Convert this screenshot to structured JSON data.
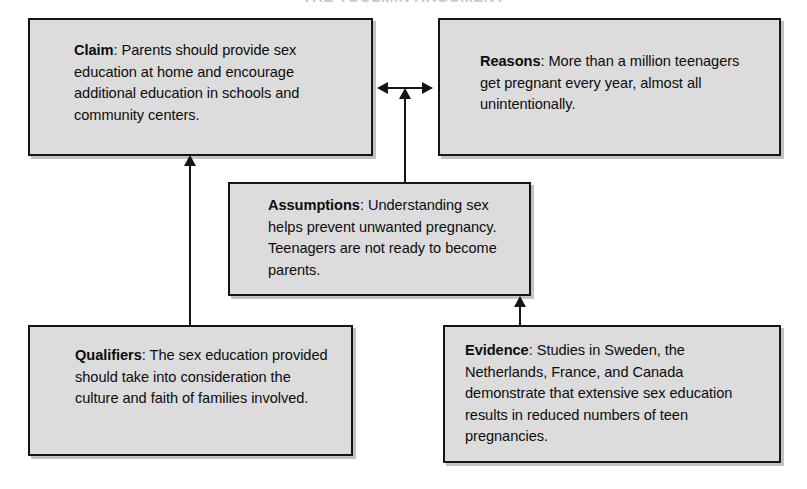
{
  "title": {
    "text": "THE TOULMIN ARGUMENT"
  },
  "diagram": {
    "nodes": {
      "claim": {
        "label": "Claim",
        "separator": ": ",
        "body": "Parents should provide sex education at home and encourage additional education in schools and community centers."
      },
      "reasons": {
        "label": "Reasons",
        "separator": ": ",
        "body": "More than a million teenagers get pregnant every year, almost all unintentionally."
      },
      "assumptions": {
        "label": "Assumptions",
        "separator": ": ",
        "body": "Understanding sex helps prevent unwanted pregnancy. Teenagers are not ready to become parents."
      },
      "qualifiers": {
        "label": "Qualifiers",
        "separator": ": ",
        "body": "The sex education provided should take into consideration the culture and faith of families involved."
      },
      "evidence": {
        "label": "Evidence",
        "separator": ": ",
        "body": "Studies in Sweden, the Netherlands, France, and Canada demonstrate that extensive sex education results in reduced numbers of teen pregnancies."
      }
    },
    "connectors": [
      {
        "name": "claim-reasons",
        "from": "claim",
        "to": "reasons",
        "style": "double-arrow-horizontal"
      },
      {
        "name": "assumptions-claim-reasons",
        "from": "assumptions",
        "to": "claim-reasons",
        "style": "arrow-up"
      },
      {
        "name": "qualifiers-claim",
        "from": "qualifiers",
        "to": "claim",
        "style": "arrow-up"
      },
      {
        "name": "evidence-assumptions",
        "from": "evidence",
        "to": "assumptions",
        "style": "arrow-up"
      }
    ]
  },
  "colors": {
    "box_fill": "#dcdcdc",
    "box_border": "#151515",
    "text": "#0c0c0c",
    "page_background": "#ffffff"
  }
}
